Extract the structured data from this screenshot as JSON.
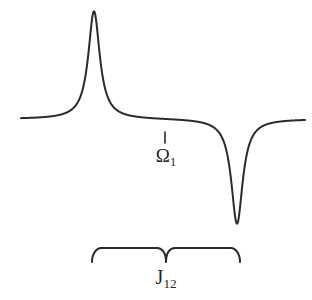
{
  "figure": {
    "background_color": "#ffffff",
    "line_color": "#2b2b2b"
  },
  "labels": {
    "resonance_offset": {
      "symbol": "Ω",
      "subscript": "1",
      "full": "Ω₁"
    },
    "coupling_constant": {
      "symbol": "J",
      "subscript": "12",
      "full": "J₁₂"
    }
  },
  "chart_data": {
    "type": "line",
    "title": "",
    "subtitle": "",
    "xlabel": "",
    "ylabel": "",
    "grid": false,
    "legend": null,
    "axes_visible": false,
    "xlim": [
      0,
      312
    ],
    "ylim": [
      0,
      300
    ],
    "baseline_y": 119,
    "x_start": 21,
    "x_end": 305,
    "series": [
      {
        "name": "antiphase doublet",
        "color": "#2b2b2b",
        "line_width": 2,
        "description": "Sum of a positive and a negative Lorentzian of equal magnitude and width, separated by the scalar coupling J12",
        "components": [
          {
            "kind": "lorentzian",
            "sign": "positive",
            "center_x": 94,
            "apex_y": 11,
            "amplitude": 108,
            "half_width": 7.0
          },
          {
            "kind": "lorentzian",
            "sign": "negative",
            "center_x": 237,
            "apex_y": 224,
            "amplitude": 105,
            "half_width": 7.0
          }
        ]
      }
    ],
    "annotations": [
      {
        "name": "resonance-offset-tick",
        "kind": "tick",
        "x": 165,
        "y_top": 132,
        "y_bottom": 143,
        "label": "Ω₁",
        "label_x": 166,
        "label_y": 158
      },
      {
        "name": "coupling-brace",
        "kind": "brace",
        "orientation": "down",
        "x_left": 92,
        "x_right": 240,
        "y_top": 245,
        "y_bottom": 262,
        "notch_x": 166,
        "label": "J₁₂",
        "label_x": 166,
        "label_y": 279
      }
    ],
    "measurements": {
      "peak_center_x": 94,
      "trough_center_x": 237,
      "splitting_px": 143,
      "splitting_meaning": "J12"
    }
  }
}
